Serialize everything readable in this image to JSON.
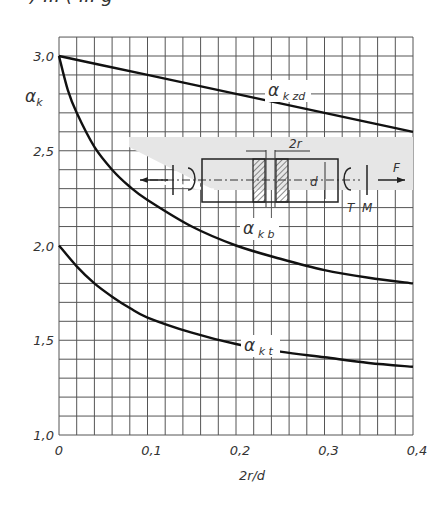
{
  "header_fragment": ") ... ( ... g",
  "chart_data": {
    "type": "line",
    "title": "",
    "xlabel": "2r/d",
    "ylabel": "αk",
    "xlim": [
      0,
      0.4
    ],
    "ylim": [
      1.0,
      3.1
    ],
    "grid": true,
    "x_ticks": [
      "0",
      "0,1",
      "0,2",
      "0,3",
      "0,4"
    ],
    "y_ticks": [
      "1,0",
      "1,5",
      "2,0",
      "2,5",
      "3,0"
    ],
    "series": [
      {
        "name": "αkzd",
        "label_main": "α",
        "label_sub": "k zd",
        "x": [
          0,
          0.05,
          0.1,
          0.15,
          0.2,
          0.25,
          0.3,
          0.35,
          0.4
        ],
        "values": [
          3.0,
          2.95,
          2.9,
          2.85,
          2.8,
          2.75,
          2.7,
          2.65,
          2.6
        ]
      },
      {
        "name": "αkb",
        "label_main": "α",
        "label_sub": "k b",
        "x": [
          0,
          0.01,
          0.02,
          0.04,
          0.06,
          0.08,
          0.1,
          0.15,
          0.2,
          0.25,
          0.3,
          0.35,
          0.4
        ],
        "values": [
          3.0,
          2.82,
          2.7,
          2.52,
          2.4,
          2.31,
          2.24,
          2.1,
          2.0,
          1.93,
          1.87,
          1.83,
          1.8
        ]
      },
      {
        "name": "αkt",
        "label_main": "α",
        "label_sub": "k t",
        "x": [
          0,
          0.02,
          0.04,
          0.06,
          0.08,
          0.1,
          0.15,
          0.2,
          0.25,
          0.3,
          0.35,
          0.4
        ],
        "values": [
          2.0,
          1.89,
          1.8,
          1.73,
          1.67,
          1.62,
          1.54,
          1.48,
          1.44,
          1.41,
          1.38,
          1.36
        ]
      }
    ],
    "inset_diagram": {
      "description": "Shaft with circumferential groove under load",
      "labels": {
        "groove": "2r",
        "diameter": "d",
        "torque": "T",
        "moment": "M",
        "force": "F"
      }
    }
  }
}
